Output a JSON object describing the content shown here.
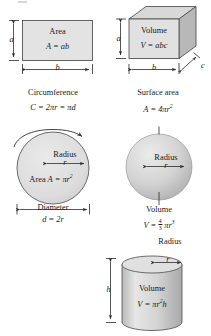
{
  "figure": {
    "colors": {
      "fill_light": "#e2e2e2",
      "fill_mid": "#d2d2d2",
      "fill_dark": "#c0c0c0",
      "stroke": "#3a3a3a",
      "text": "#1a1a1a"
    }
  },
  "rectangle": {
    "label_a": "a",
    "label_b": "b",
    "title": "Area",
    "formula_lhs": "A",
    "formula_eq": "=",
    "formula_rhs": "ab"
  },
  "box": {
    "label_a": "a",
    "label_b": "b",
    "label_c": "c",
    "title": "Volume",
    "formula_lhs": "V",
    "formula_eq": "=",
    "formula_rhs": "abc"
  },
  "circle": {
    "circumference_caption": "Circumference",
    "circumference_formula": "C = 2πr = πd",
    "circumference_lhs": "C",
    "circumference_mid": "2πr",
    "circumference_alt": "πd",
    "radius_caption": "Radius",
    "radius_symbol": "r",
    "area_caption": "Area",
    "area_lhs": "A",
    "area_rhs_base": "πr",
    "area_rhs_exp": "2",
    "diameter_caption": "Diameter",
    "diameter_lhs": "d",
    "diameter_rhs": "2r"
  },
  "sphere": {
    "surface_caption": "Surface area",
    "surface_lhs": "A",
    "surface_rhs_base": "4πr",
    "surface_rhs_exp": "2",
    "radius_caption": "Radius",
    "radius_symbol": "r",
    "volume_caption": "Volume",
    "volume_lhs": "V",
    "volume_frac_num": "4",
    "volume_frac_den": "3",
    "volume_rhs_base": "πr",
    "volume_rhs_exp": "3"
  },
  "cylinder": {
    "radius_caption": "Radius",
    "radius_symbol": "r",
    "height_symbol": "h",
    "volume_caption": "Volume",
    "volume_lhs": "V",
    "volume_rhs_base": "πr",
    "volume_rhs_exp": "2",
    "volume_rhs_tail": "h"
  },
  "equals": "="
}
